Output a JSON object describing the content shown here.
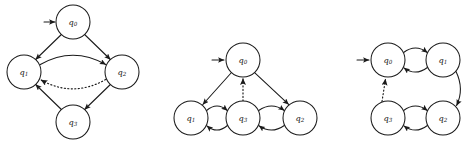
{
  "figure": {
    "background_color": "#ffffff",
    "stroke_color": "#1a1a1a",
    "width": 469,
    "height": 146
  },
  "diagrams": [
    {
      "id": "automaton-left",
      "name": "left-automaton",
      "layout": "diamond",
      "start_state": "q0",
      "states": [
        {
          "id": "q0",
          "label": "q",
          "subscript": "0",
          "cx": 73,
          "cy": 22,
          "r": 17
        },
        {
          "id": "q1",
          "label": "q",
          "subscript": "1",
          "cx": 24,
          "cy": 72,
          "r": 17
        },
        {
          "id": "q2",
          "label": "q",
          "subscript": "2",
          "cx": 122,
          "cy": 72,
          "r": 17
        },
        {
          "id": "q3",
          "label": "q",
          "subscript": "3",
          "cx": 73,
          "cy": 122,
          "r": 17
        }
      ],
      "start_arrow": {
        "from_x": 44,
        "from_y": 22,
        "to_x": 55,
        "to_y": 22
      },
      "transitions": [
        {
          "from": "q0",
          "to": "q1",
          "style": "solid",
          "shape": "straight"
        },
        {
          "from": "q0",
          "to": "q2",
          "style": "solid",
          "shape": "straight"
        },
        {
          "from": "q1",
          "to": "q2",
          "style": "solid",
          "shape": "curve-up"
        },
        {
          "from": "q2",
          "to": "q1",
          "style": "dotted",
          "shape": "curve-down"
        },
        {
          "from": "q2",
          "to": "q3",
          "style": "solid",
          "shape": "straight"
        },
        {
          "from": "q3",
          "to": "q1",
          "style": "solid",
          "shape": "straight"
        }
      ]
    },
    {
      "id": "automaton-middle",
      "name": "middle-automaton",
      "layout": "star",
      "start_state": "q0",
      "states": [
        {
          "id": "q0",
          "label": "q",
          "subscript": "0",
          "cx": 243,
          "cy": 60,
          "r": 17
        },
        {
          "id": "q1",
          "label": "q",
          "subscript": "1",
          "cx": 191,
          "cy": 118,
          "r": 17
        },
        {
          "id": "q3",
          "label": "q",
          "subscript": "3",
          "cx": 243,
          "cy": 118,
          "r": 17
        },
        {
          "id": "q2",
          "label": "q",
          "subscript": "2",
          "cx": 300,
          "cy": 118,
          "r": 17
        }
      ],
      "start_arrow": {
        "from_x": 212,
        "from_y": 60,
        "to_x": 224,
        "to_y": 60
      },
      "transitions": [
        {
          "from": "q0",
          "to": "q1",
          "style": "solid",
          "shape": "straight"
        },
        {
          "from": "q0",
          "to": "q2",
          "style": "solid",
          "shape": "straight"
        },
        {
          "from": "q3",
          "to": "q0",
          "style": "dotted",
          "shape": "straight"
        },
        {
          "from": "q1",
          "to": "q3",
          "style": "solid",
          "shape": "curve-up"
        },
        {
          "from": "q3",
          "to": "q1",
          "style": "solid",
          "shape": "curve-down"
        },
        {
          "from": "q3",
          "to": "q2",
          "style": "solid",
          "shape": "curve-up"
        },
        {
          "from": "q2",
          "to": "q3",
          "style": "solid",
          "shape": "curve-down"
        }
      ]
    },
    {
      "id": "automaton-right",
      "name": "right-automaton",
      "layout": "square",
      "start_state": "q0",
      "states": [
        {
          "id": "q0",
          "label": "q",
          "subscript": "0",
          "cx": 388,
          "cy": 60,
          "r": 17
        },
        {
          "id": "q1",
          "label": "q",
          "subscript": "1",
          "cx": 443,
          "cy": 60,
          "r": 17
        },
        {
          "id": "q3",
          "label": "q",
          "subscript": "3",
          "cx": 388,
          "cy": 118,
          "r": 17
        },
        {
          "id": "q2",
          "label": "q",
          "subscript": "2",
          "cx": 443,
          "cy": 118,
          "r": 17
        }
      ],
      "start_arrow": {
        "from_x": 357,
        "from_y": 60,
        "to_x": 369,
        "to_y": 60
      },
      "transitions": [
        {
          "from": "q0",
          "to": "q1",
          "style": "solid",
          "shape": "curve-up"
        },
        {
          "from": "q1",
          "to": "q0",
          "style": "solid",
          "shape": "curve-down"
        },
        {
          "from": "q1",
          "to": "q2",
          "style": "solid",
          "shape": "curve-right"
        },
        {
          "from": "q3",
          "to": "q2",
          "style": "solid",
          "shape": "curve-up"
        },
        {
          "from": "q2",
          "to": "q3",
          "style": "solid",
          "shape": "curve-down"
        },
        {
          "from": "q3",
          "to": "q0",
          "style": "dotted",
          "shape": "straight"
        }
      ]
    }
  ]
}
